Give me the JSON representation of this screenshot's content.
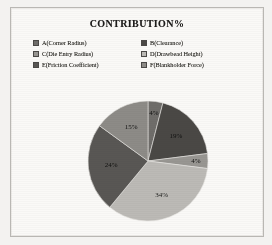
{
  "figure": {
    "title": "CONTRIBUTION%",
    "page_background": "#faf9f7",
    "border_color": "#b9b7b3"
  },
  "legend": {
    "items": [
      {
        "key": "A",
        "label": "A(Corner Radius)",
        "color": "#6f6d6a"
      },
      {
        "key": "B",
        "label": "B(Clearance)",
        "color": "#4a4845"
      },
      {
        "key": "C",
        "label": "C(Die Entry Radius)",
        "color": "#989692"
      },
      {
        "key": "D",
        "label": "D(Drawbead Height)",
        "color": "#bcbab6"
      },
      {
        "key": "E",
        "label": "E(Friction Coefficient)",
        "color": "#595754"
      },
      {
        "key": "F",
        "label": "F(Blankholder Force)",
        "color": "#8d8b87"
      }
    ]
  },
  "chart_data": {
    "type": "pie",
    "title": "CONTRIBUTION%",
    "xlabel": "",
    "ylabel": "",
    "legend_position": "top",
    "grid": false,
    "categories": [
      "A(Corner Radius)",
      "B(Clearance)",
      "C(Die Entry Radius)",
      "D(Drawbead Height)",
      "E(Friction Coefficient)",
      "F(Blankholder Force)"
    ],
    "values": [
      4,
      19,
      4,
      34,
      24,
      15
    ],
    "value_labels": [
      "4%",
      "19%",
      "4%",
      "34%",
      "24%",
      "15%"
    ],
    "colors": [
      "#6f6d6a",
      "#4a4845",
      "#989692",
      "#bcbab6",
      "#595754",
      "#8d8b87"
    ],
    "start_angle_deg": 0,
    "direction": "clockwise",
    "total": 100,
    "units": "%"
  }
}
